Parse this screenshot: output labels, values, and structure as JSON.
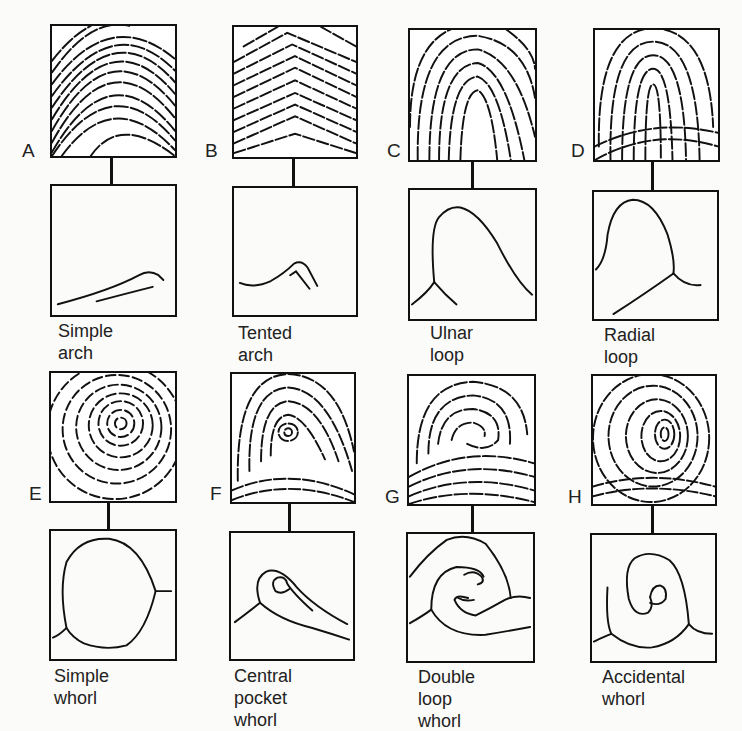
{
  "figure": {
    "panels": [
      {
        "letter": "A",
        "caption": "Simple arch"
      },
      {
        "letter": "B",
        "caption": "Tented arch"
      },
      {
        "letter": "C",
        "caption": "Ulnar loop"
      },
      {
        "letter": "D",
        "caption": "Radial loop"
      },
      {
        "letter": "E",
        "caption": "Simple whorl"
      },
      {
        "letter": "F",
        "caption": "Central\npocket whorl"
      },
      {
        "letter": "G",
        "caption": "Double loop\nwhorl"
      },
      {
        "letter": "H",
        "caption": "Accidental\nwhorl"
      }
    ],
    "colors": {
      "ink": "#111111",
      "paper": "#fbfbf9"
    }
  }
}
